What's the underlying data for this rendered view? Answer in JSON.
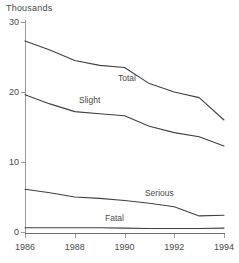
{
  "chart_data": {
    "type": "line",
    "title": "",
    "unit_label": "Thousands",
    "xlabel": "",
    "ylabel": "Thousands",
    "x": [
      1986,
      1987,
      1988,
      1989,
      1990,
      1991,
      1992,
      1993,
      1994
    ],
    "xlim": [
      1986,
      1994
    ],
    "ylim": [
      0,
      30
    ],
    "xticks": [
      1986,
      1988,
      1990,
      1992,
      1994
    ],
    "xtick_labels": [
      "1986",
      "1988",
      "1990",
      "1992",
      "1994"
    ],
    "yticks": [
      0,
      10,
      20,
      30
    ],
    "ytick_labels": [
      "0",
      "10",
      "20",
      "30"
    ],
    "grid": false,
    "legend_position": "inline-labels",
    "line_color": "#404040",
    "axis_color": "#9a9a9a",
    "background": "#ffffff",
    "series": [
      {
        "name": "Total",
        "label": "Total",
        "label_x": 1990.1,
        "label_y": 21.6,
        "values": [
          27.3,
          26.0,
          24.5,
          23.8,
          23.5,
          21.2,
          20.0,
          19.2,
          16.0
        ]
      },
      {
        "name": "Slight",
        "label": "Slight",
        "label_x": 1988.6,
        "label_y": 18.4,
        "values": [
          19.6,
          18.3,
          17.2,
          16.9,
          16.6,
          15.1,
          14.2,
          13.6,
          12.3
        ]
      },
      {
        "name": "Serious",
        "label": "Serious",
        "label_x": 1991.4,
        "label_y": 5.2,
        "values": [
          6.1,
          5.6,
          5.0,
          4.8,
          4.5,
          4.1,
          3.6,
          2.3,
          2.4
        ]
      },
      {
        "name": "Fatal",
        "label": "Fatal",
        "label_x": 1989.6,
        "label_y": 1.6,
        "values": [
          0.6,
          0.6,
          0.6,
          0.6,
          0.55,
          0.5,
          0.5,
          0.5,
          0.55
        ]
      }
    ]
  }
}
